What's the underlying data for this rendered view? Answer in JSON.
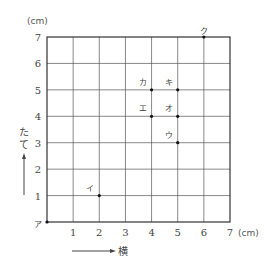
{
  "chart_data": {
    "type": "scatter",
    "title": "",
    "xlabel": "横",
    "ylabel": "たて",
    "x_unit": "(cm)",
    "y_unit": "(cm)",
    "xlim": [
      0,
      7
    ],
    "ylim": [
      0,
      7
    ],
    "grid": true,
    "x_ticks": [
      "1",
      "2",
      "3",
      "4",
      "5",
      "6",
      "7"
    ],
    "y_ticks": [
      "1",
      "2",
      "3",
      "4",
      "5",
      "6",
      "7"
    ],
    "points": [
      {
        "label": "ア",
        "x": 0,
        "y": 0
      },
      {
        "label": "イ",
        "x": 2,
        "y": 1
      },
      {
        "label": "ウ",
        "x": 5,
        "y": 3
      },
      {
        "label": "エ",
        "x": 4,
        "y": 4
      },
      {
        "label": "オ",
        "x": 5,
        "y": 4
      },
      {
        "label": "カ",
        "x": 4,
        "y": 5
      },
      {
        "label": "キ",
        "x": 5,
        "y": 5
      },
      {
        "label": "ク",
        "x": 6,
        "y": 7
      }
    ]
  },
  "labels": {
    "x_unit": "(cm)",
    "y_unit": "(cm)",
    "x_axis_name": "横",
    "y_axis_name_1": "た",
    "y_axis_name_2": "て"
  },
  "colors": {
    "grid": "#555555",
    "frame": "#333333",
    "point": "#111111"
  }
}
